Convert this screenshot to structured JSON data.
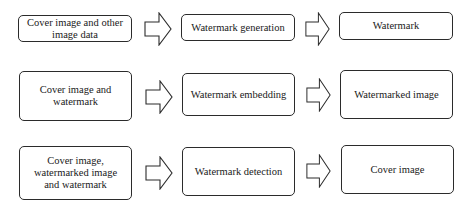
{
  "rows": [
    {
      "input": "Cover image and other image data",
      "process": "Watermark generation",
      "output": "Watermark"
    },
    {
      "input": "Cover image and watermark",
      "process": "Watermark embedding",
      "output": "Watermarked image"
    },
    {
      "input": "Cover image, watermarked image and watermark",
      "process": "Watermark detection",
      "output": "Cover image"
    }
  ],
  "colors": {
    "stroke": "#2b2b2b",
    "fill": "#ffffff"
  }
}
